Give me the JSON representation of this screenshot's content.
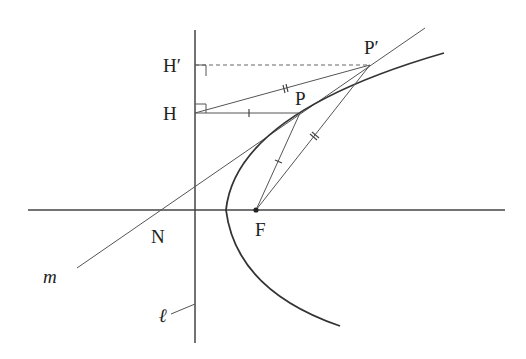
{
  "diagram": {
    "labels": {
      "H_prime": "H′",
      "H": "H",
      "P_prime": "P′",
      "P": "P",
      "N": "N",
      "F": "F",
      "m": "m",
      "ell": "ℓ"
    },
    "colors": {
      "ink": "#333333",
      "thin": "#555555",
      "background": "#ffffff"
    }
  }
}
